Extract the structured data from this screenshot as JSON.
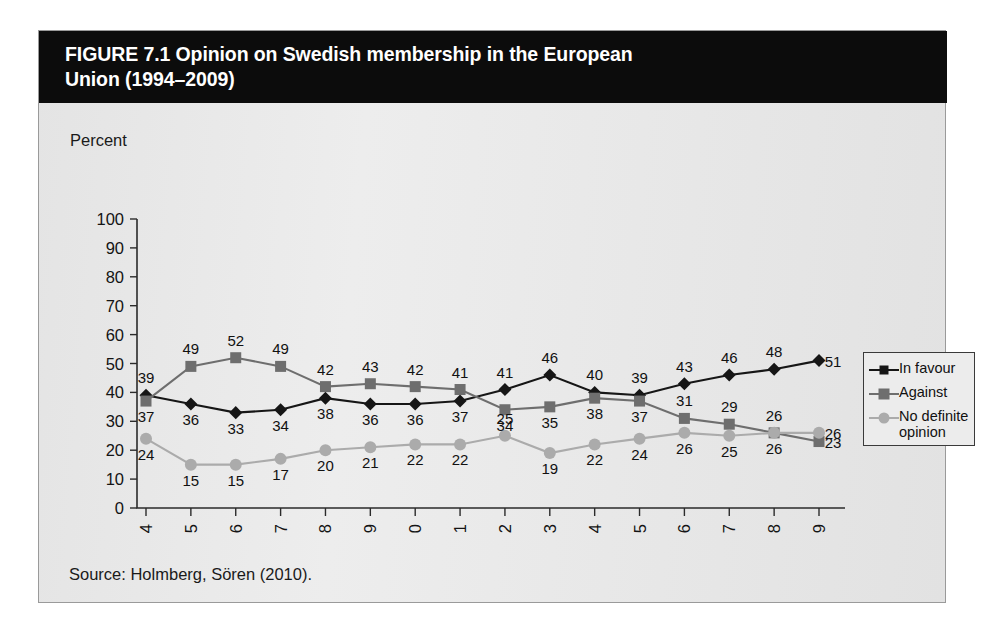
{
  "figure": {
    "title": "FIGURE 7.1  Opinion on Swedish membership in the European\nUnion (1994–2009)",
    "source": "Source: Holmberg, Sören (2010).",
    "axis_unit_label": "Percent"
  },
  "colors": {
    "title_bar_bg": "#0c0c0c",
    "title_text": "#ffffff",
    "panel_bg": "#e9e9e9",
    "panel_border": "#9a9a9a",
    "axis": "#2b2b2b",
    "in_favour": "#161616",
    "against": "#6e6e6e",
    "no_definite_opinion": "#ababab",
    "label_text": "#111111"
  },
  "legend": {
    "position": "right",
    "entries": [
      {
        "label": "In favour",
        "marker": "diamond",
        "color": "#161616"
      },
      {
        "label": "Against",
        "marker": "square",
        "color": "#6e6e6e"
      },
      {
        "label": "No definite\nopinion",
        "marker": "circle",
        "color": "#ababab"
      }
    ]
  },
  "chart_data": {
    "type": "line",
    "title": "FIGURE 7.1  Opinion on Swedish membership in the European Union (1994–2009)",
    "xlabel": "",
    "ylabel": "Percent",
    "ylim": [
      0,
      100
    ],
    "yticks": [
      0,
      10,
      20,
      30,
      40,
      50,
      60,
      70,
      80,
      90,
      100
    ],
    "grid": false,
    "legend_position": "right",
    "data_labels": true,
    "categories": [
      "1994",
      "1995",
      "1996",
      "1997",
      "1998",
      "1999",
      "2000",
      "2001",
      "2002",
      "2003",
      "2004",
      "2005",
      "2006",
      "2007",
      "2008",
      "2009"
    ],
    "series": [
      {
        "name": "In favour",
        "marker": "diamond",
        "color": "#161616",
        "values": [
          39,
          36,
          33,
          34,
          38,
          36,
          36,
          37,
          41,
          46,
          40,
          39,
          43,
          46,
          48,
          51
        ],
        "label_side": [
          "above",
          "below",
          "below",
          "below",
          "below",
          "below",
          "below",
          "below",
          "above",
          "above",
          "above",
          "above",
          "above",
          "above",
          "above",
          "right"
        ]
      },
      {
        "name": "Against",
        "marker": "square",
        "color": "#6e6e6e",
        "values": [
          37,
          49,
          52,
          49,
          42,
          43,
          42,
          41,
          34,
          35,
          38,
          37,
          31,
          29,
          26,
          23
        ],
        "label_side": [
          "below",
          "above",
          "above",
          "above",
          "above",
          "above",
          "above",
          "above",
          "below",
          "below",
          "below",
          "below",
          "above",
          "above",
          "above",
          "right"
        ]
      },
      {
        "name": "No definite opinion",
        "marker": "circle",
        "color": "#ababab",
        "values": [
          24,
          15,
          15,
          17,
          20,
          21,
          22,
          22,
          25,
          19,
          22,
          24,
          26,
          25,
          26,
          26
        ],
        "label_side": [
          "below",
          "below",
          "below",
          "below",
          "below",
          "below",
          "below",
          "below",
          "above",
          "below",
          "below",
          "below",
          "below",
          "below",
          "below",
          "right"
        ]
      }
    ]
  }
}
